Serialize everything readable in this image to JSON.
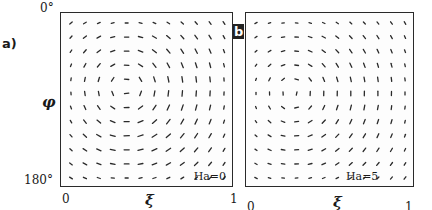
{
  "chart_data": [
    {
      "type": "vector_field",
      "panel": "a)",
      "annotation": "Ha=0",
      "xlabel": "ξ",
      "ylabel": "φ",
      "xlim": [
        0,
        1
      ],
      "ylim_labels": [
        "0°",
        "180°"
      ],
      "x_ticks": [
        "0",
        "1"
      ],
      "grid": {
        "cols": 12,
        "rows": 12
      },
      "vortex": {
        "cx": 0.36,
        "cy": 0.42,
        "strength": 1.0,
        "decay": 0.6
      }
    },
    {
      "type": "vector_field",
      "panel": "b",
      "annotation": "Ha=5",
      "xlabel": "ξ",
      "ylabel": "",
      "xlim": [
        0,
        1
      ],
      "x_ticks": [
        "0",
        "1"
      ],
      "grid": {
        "cols": 12,
        "rows": 12
      },
      "vortex": {
        "cx": 0.25,
        "cy": 0.45,
        "strength": 0.85,
        "decay": 0.35
      }
    }
  ],
  "labels": {
    "a_tag": "a)",
    "b_tag": "b",
    "y_top": "0°",
    "y_bottom": "180°",
    "phi": "φ",
    "xi": "ξ",
    "a_x0": "0",
    "a_x1": "1",
    "b_x0": "0",
    "b_x1": "1",
    "a_ha": "Ha=0",
    "b_ha": "Ha=5"
  },
  "style": {
    "ink": "#2a2a2a"
  }
}
